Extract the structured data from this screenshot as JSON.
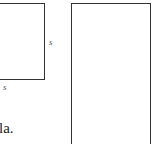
{
  "figure": {
    "square": {
      "side_label_right": "s",
      "side_label_bottom": "s"
    },
    "rectangle": {},
    "caption_fragment": "la."
  }
}
